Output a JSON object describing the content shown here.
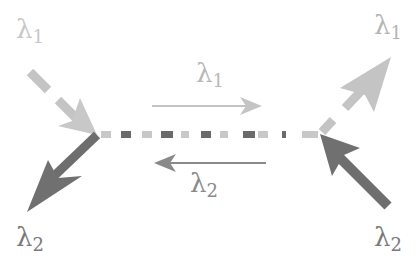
{
  "diagram": {
    "labels": {
      "top_left": {
        "symbol": "λ",
        "sub": "1",
        "color": "#c8c8c8"
      },
      "top_right": {
        "symbol": "λ",
        "sub": "1",
        "color": "#b4b4b4"
      },
      "bottom_left": {
        "symbol": "λ",
        "sub": "2",
        "color": "#7a7a7a"
      },
      "bottom_right": {
        "symbol": "λ",
        "sub": "2",
        "color": "#7a7a7a"
      },
      "middle_top": {
        "symbol": "λ",
        "sub": "1",
        "color": "#b8b8b8"
      },
      "middle_bottom": {
        "symbol": "λ",
        "sub": "2",
        "color": "#8a8a8a"
      }
    },
    "colors": {
      "lambda1": "#c4c4c4",
      "lambda2": "#6e6e6e",
      "dash_light": "#c8c8c8",
      "dash_dark": "#6a6a6a"
    }
  }
}
